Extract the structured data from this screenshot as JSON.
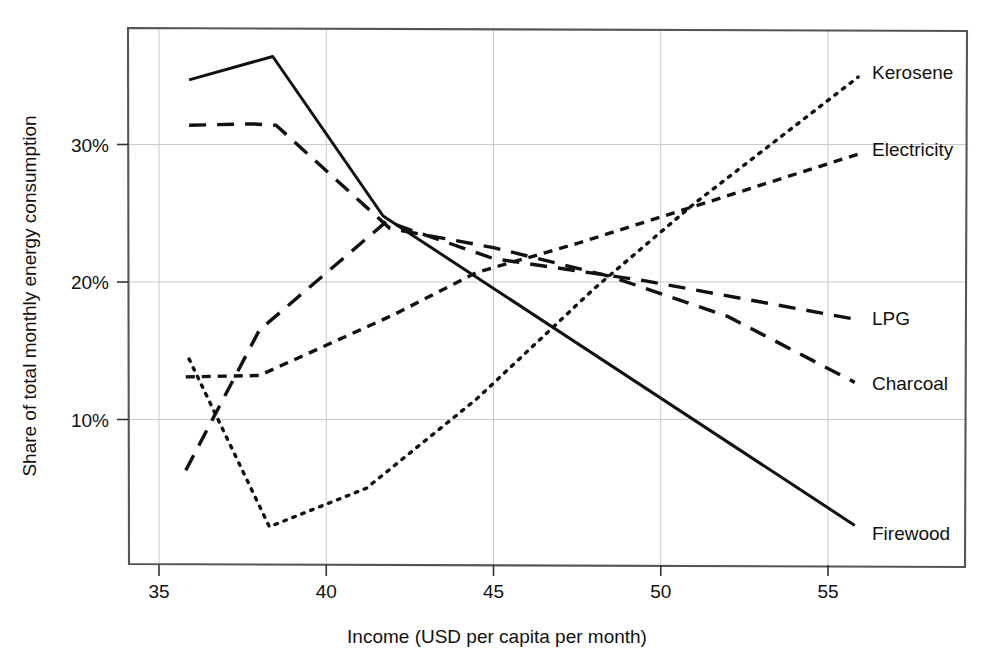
{
  "chart_data": {
    "type": "line",
    "title": "",
    "subtitle": "",
    "xlabel": "Income (USD per capita per month)",
    "ylabel": "Share of total monthly energy consumption",
    "xlim": [
      34.1,
      59.0
    ],
    "ylim": [
      0.5,
      39.7
    ],
    "xticks": [
      35,
      40,
      45,
      50,
      55
    ],
    "xtick_labels": [
      "35",
      "40",
      "45",
      "50",
      "55"
    ],
    "yticks": [
      10,
      20,
      30
    ],
    "ytick_labels": [
      "10%",
      "20%",
      "30%"
    ],
    "grid": "both",
    "legend_position": "right-of-line-ends",
    "value_unit": "percent",
    "series": [
      {
        "name": "Firewood",
        "label": "Firewood",
        "style": "solid",
        "color": "#111111",
        "points": [
          {
            "x": 35.9,
            "y": 34.7
          },
          {
            "x": 38.4,
            "y": 36.4
          },
          {
            "x": 41.7,
            "y": 24.8
          },
          {
            "x": 55.8,
            "y": 2.3
          }
        ]
      },
      {
        "name": "Charcoal",
        "label": "Charcoal",
        "style": "dashed-long",
        "color": "#111111",
        "points": [
          {
            "x": 35.9,
            "y": 31.4
          },
          {
            "x": 37.8,
            "y": 31.5
          },
          {
            "x": 38.5,
            "y": 31.4
          },
          {
            "x": 41.9,
            "y": 23.9
          },
          {
            "x": 45.0,
            "y": 22.5
          },
          {
            "x": 48.5,
            "y": 20.4
          },
          {
            "x": 52.0,
            "y": 17.5
          },
          {
            "x": 55.8,
            "y": 12.7
          }
        ]
      },
      {
        "name": "LPG",
        "label": "LPG",
        "style": "dashed-long",
        "color": "#111111",
        "points": [
          {
            "x": 35.8,
            "y": 6.3
          },
          {
            "x": 38.0,
            "y": 16.5
          },
          {
            "x": 41.8,
            "y": 24.4
          },
          {
            "x": 45.0,
            "y": 21.7
          },
          {
            "x": 49.5,
            "y": 20.1
          },
          {
            "x": 55.8,
            "y": 17.3
          }
        ]
      },
      {
        "name": "Electricity",
        "label": "Electricity",
        "style": "dashed-short",
        "color": "#111111",
        "points": [
          {
            "x": 35.8,
            "y": 13.1
          },
          {
            "x": 38.0,
            "y": 13.2
          },
          {
            "x": 40.0,
            "y": 15.4
          },
          {
            "x": 42.0,
            "y": 17.6
          },
          {
            "x": 44.5,
            "y": 20.7
          },
          {
            "x": 47.5,
            "y": 22.8
          },
          {
            "x": 51.0,
            "y": 25.5
          },
          {
            "x": 55.9,
            "y": 29.3
          }
        ]
      },
      {
        "name": "Kerosene",
        "label": "Kerosene",
        "style": "dotted",
        "color": "#111111",
        "points": [
          {
            "x": 35.9,
            "y": 14.4
          },
          {
            "x": 38.3,
            "y": 2.2
          },
          {
            "x": 41.2,
            "y": 5.0
          },
          {
            "x": 44.5,
            "y": 11.5
          },
          {
            "x": 48.0,
            "y": 19.5
          },
          {
            "x": 51.0,
            "y": 25.7
          },
          {
            "x": 55.9,
            "y": 34.9
          }
        ]
      }
    ],
    "series_end_labels": [
      {
        "name": "Kerosene",
        "text": "Kerosene",
        "x_px": 872,
        "y_px": 79
      },
      {
        "name": "Electricity",
        "text": "Electricity",
        "x_px": 872,
        "y_px": 156
      },
      {
        "name": "LPG",
        "text": "LPG",
        "x_px": 872,
        "y_px": 325
      },
      {
        "name": "Charcoal",
        "text": "Charcoal",
        "x_px": 872,
        "y_px": 390
      },
      {
        "name": "Firewood",
        "text": "Firewood",
        "x_px": 872,
        "y_px": 540
      }
    ]
  },
  "axes": {
    "frame_color": "#555555",
    "grid_color": "#c9c9c9",
    "line_color": "#111111"
  }
}
